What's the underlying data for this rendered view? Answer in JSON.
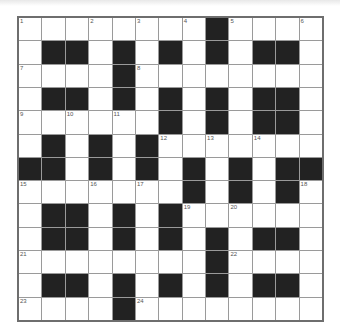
{
  "puzzle": {
    "rows": 13,
    "cols": 13,
    "grid": [
      "........#....",
      ".##.#.#.#.##.",
      "....#........",
      ".##.#.#.#.##.",
      "......#.#.##.",
      ".#.#.#.......",
      "##.#.#.#.#.##",
      ".......#.#.#.",
      ".##.#.#......",
      ".##.#.#.#.##.",
      "........#....",
      ".##.#.#.#.##.",
      "....#........"
    ],
    "numbers": [
      {
        "r": 0,
        "c": 0,
        "n": "1"
      },
      {
        "r": 0,
        "c": 3,
        "n": "2"
      },
      {
        "r": 0,
        "c": 5,
        "n": "3"
      },
      {
        "r": 0,
        "c": 7,
        "n": "4"
      },
      {
        "r": 0,
        "c": 9,
        "n": "5"
      },
      {
        "r": 0,
        "c": 12,
        "n": "6"
      },
      {
        "r": 2,
        "c": 0,
        "n": "7"
      },
      {
        "r": 2,
        "c": 5,
        "n": "8"
      },
      {
        "r": 4,
        "c": 0,
        "n": "9"
      },
      {
        "r": 4,
        "c": 2,
        "n": "10"
      },
      {
        "r": 4,
        "c": 4,
        "n": "11"
      },
      {
        "r": 5,
        "c": 6,
        "n": "12"
      },
      {
        "r": 5,
        "c": 8,
        "n": "13"
      },
      {
        "r": 5,
        "c": 10,
        "n": "14"
      },
      {
        "r": 7,
        "c": 0,
        "n": "15"
      },
      {
        "r": 7,
        "c": 3,
        "n": "16"
      },
      {
        "r": 7,
        "c": 5,
        "n": "17"
      },
      {
        "r": 7,
        "c": 12,
        "n": "18"
      },
      {
        "r": 8,
        "c": 7,
        "n": "19"
      },
      {
        "r": 8,
        "c": 9,
        "n": "20"
      },
      {
        "r": 10,
        "c": 0,
        "n": "21"
      },
      {
        "r": 10,
        "c": 9,
        "n": "22"
      },
      {
        "r": 12,
        "c": 0,
        "n": "23"
      },
      {
        "r": 12,
        "c": 5,
        "n": "24"
      }
    ]
  }
}
